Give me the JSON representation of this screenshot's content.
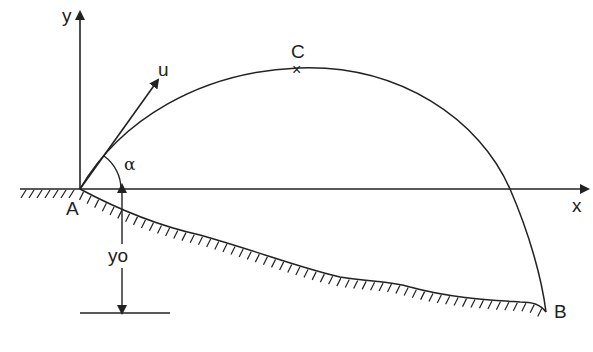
{
  "diagram": {
    "type": "projectile-motion-on-slope",
    "colors": {
      "line": "#222222",
      "background": "#ffffff"
    },
    "axes": {
      "x_label": "x",
      "y_label": "y"
    },
    "points": {
      "launch": "A",
      "apex": "C",
      "landing": "B",
      "apex_marker": "×"
    },
    "labels": {
      "velocity": "u",
      "angle": "α",
      "height": "yo"
    }
  }
}
